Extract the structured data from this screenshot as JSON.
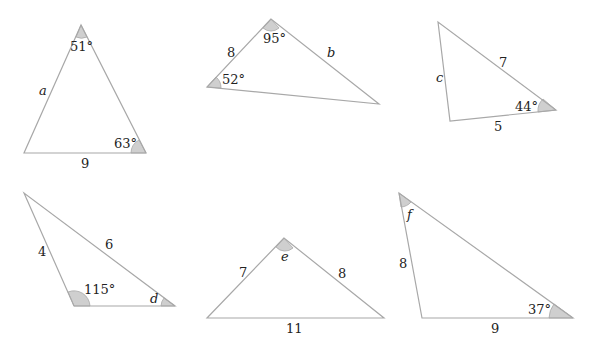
{
  "colors": {
    "edge": "#a8a8a8",
    "angle_fill": "#cfcfcf",
    "text": "#222222",
    "background": "#ffffff"
  },
  "triangles": [
    {
      "id": "t1",
      "vertices": [
        [
          81,
          25
        ],
        [
          24,
          153
        ],
        [
          146,
          153
        ]
      ],
      "labels": {
        "angle_top": "51°",
        "angle_right": "63°",
        "side_left": "a",
        "side_bottom": "9"
      }
    },
    {
      "id": "t2",
      "vertices": [
        [
          271,
          19
        ],
        [
          207,
          87
        ],
        [
          379,
          104
        ]
      ],
      "labels": {
        "angle_top": "95°",
        "angle_left": "52°",
        "side_left": "8",
        "side_right": "b"
      }
    },
    {
      "id": "t3",
      "vertices": [
        [
          438,
          22
        ],
        [
          450,
          121
        ],
        [
          556,
          110
        ]
      ],
      "labels": {
        "angle_right": "44°",
        "side_left": "c",
        "side_hyp": "7",
        "side_bottom": "5"
      }
    },
    {
      "id": "t4",
      "vertices": [
        [
          24,
          193
        ],
        [
          74,
          306
        ],
        [
          175,
          306
        ]
      ],
      "labels": {
        "angle_bottom_left": "115°",
        "angle_right": "d",
        "side_left": "4",
        "side_hyp": "6"
      }
    },
    {
      "id": "t5",
      "vertices": [
        [
          284,
          238
        ],
        [
          207,
          318
        ],
        [
          384,
          318
        ]
      ],
      "labels": {
        "angle_top": "e",
        "side_left": "7",
        "side_right": "8",
        "side_bottom": "11"
      }
    },
    {
      "id": "t6",
      "vertices": [
        [
          399,
          193
        ],
        [
          422,
          318
        ],
        [
          573,
          318
        ]
      ],
      "labels": {
        "angle_top": "f",
        "angle_right": "37°",
        "side_left": "8",
        "side_bottom": "9"
      }
    }
  ]
}
